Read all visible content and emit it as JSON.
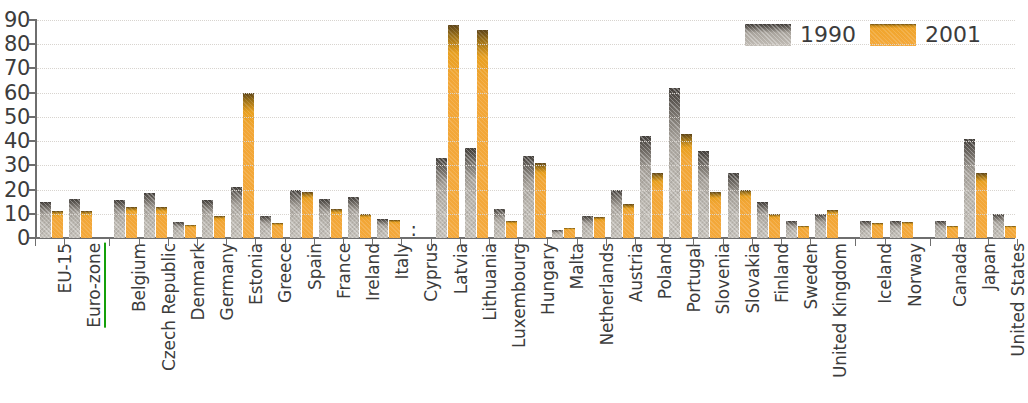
{
  "chart_data": {
    "type": "bar",
    "title": "",
    "subtitle": "",
    "xlabel": "",
    "ylabel": "",
    "ylim": [
      0,
      90
    ],
    "ytick_step": 10,
    "yticks": [
      "0",
      "10",
      "20",
      "30",
      "40",
      "50",
      "60",
      "70",
      "80",
      "90"
    ],
    "grid": true,
    "legend_position": "top-right",
    "no_data_symbol": ":",
    "categories": [
      "EU-15",
      "Euro-zone",
      "Belgium",
      "Czech Republic",
      "Denmark",
      "Germany",
      "Estonia",
      "Greece",
      "Spain",
      "France",
      "Ireland",
      "Italy",
      "Cyprus",
      "Latvia",
      "Lithuania",
      "Luxembourg",
      "Hungary",
      "Malta",
      "Netherlands",
      "Austria",
      "Poland",
      "Portugal",
      "Slovenia",
      "Slovakia",
      "Finland",
      "Sweden",
      "United Kingdom",
      "Iceland",
      "Norway",
      "Canada",
      "Japan",
      "United States"
    ],
    "highlighted_categories": [
      "Euro-zone"
    ],
    "highlight_color": "#14a00a",
    "group_breaks_after": [
      "Euro-zone",
      "United Kingdom",
      "Norway"
    ],
    "series": [
      {
        "name": "1990",
        "color": "#b5b0a9",
        "values": [
          15,
          16,
          15.5,
          18.5,
          6.5,
          15.5,
          21,
          9,
          20,
          16,
          17,
          8,
          null,
          33,
          37,
          12,
          34,
          3.5,
          9,
          20,
          42,
          62,
          36,
          27,
          15,
          7,
          10,
          7,
          7,
          7,
          41,
          10
        ]
      },
      {
        "name": "2001",
        "color": "#f4a93c",
        "values": [
          11,
          11,
          13,
          13,
          5.5,
          9,
          60,
          6,
          19,
          12,
          10,
          7.5,
          null,
          88,
          86,
          7,
          31,
          4,
          8.5,
          14,
          27,
          43,
          19,
          20,
          10,
          5,
          11.5,
          6,
          6.5,
          5,
          27,
          5
        ]
      }
    ]
  },
  "legend": {
    "items": [
      {
        "label": "1990",
        "swatch": "series-1990-swatch"
      },
      {
        "label": "2001",
        "swatch": "series-2001-swatch"
      }
    ]
  }
}
